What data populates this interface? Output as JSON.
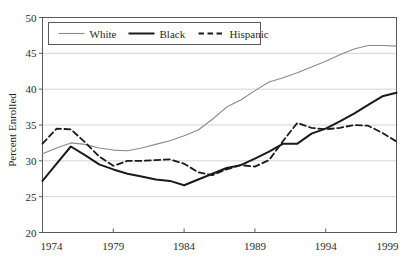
{
  "chart_data": {
    "type": "line",
    "title": "",
    "xlabel": "",
    "ylabel": "Percent Enrolled",
    "xlim": [
      1974,
      1999
    ],
    "ylim": [
      20,
      50
    ],
    "xticks": [
      1974,
      1979,
      1984,
      1989,
      1994,
      1999
    ],
    "yticks": [
      20,
      25,
      30,
      35,
      40,
      45,
      50
    ],
    "grid": "horizontal",
    "legend_position": "top-left-inside",
    "x": [
      1974,
      1975,
      1976,
      1977,
      1978,
      1979,
      1980,
      1981,
      1982,
      1983,
      1984,
      1985,
      1986,
      1987,
      1988,
      1989,
      1990,
      1991,
      1992,
      1993,
      1994,
      1995,
      1996,
      1997,
      1998,
      1999
    ],
    "series": [
      {
        "name": "White",
        "color": "#8a8a8a",
        "style": "solid",
        "width": 1.1,
        "values": [
          31.0,
          31.8,
          32.5,
          32.3,
          31.8,
          31.5,
          31.4,
          31.8,
          32.3,
          32.8,
          33.5,
          34.3,
          35.8,
          37.5,
          38.5,
          39.8,
          41.0,
          41.6,
          42.3,
          43.1,
          43.9,
          44.8,
          45.6,
          46.1,
          46.1,
          46.0
        ]
      },
      {
        "name": "Black",
        "color": "#1a1a1a",
        "style": "solid",
        "width": 2.0,
        "values": [
          27.2,
          29.6,
          32.0,
          30.8,
          29.5,
          28.8,
          28.2,
          27.8,
          27.4,
          27.2,
          26.6,
          27.4,
          28.2,
          29.0,
          29.4,
          30.3,
          31.3,
          32.4,
          32.4,
          33.8,
          34.5,
          35.5,
          36.6,
          37.8,
          39.0,
          39.5
        ]
      },
      {
        "name": "Hispanic",
        "color": "#1a1a1a",
        "style": "dashed",
        "width": 1.8,
        "values": [
          32.4,
          34.5,
          34.4,
          32.6,
          30.6,
          29.3,
          30.0,
          30.0,
          30.1,
          30.2,
          29.6,
          28.4,
          28.0,
          28.8,
          29.4,
          29.2,
          30.1,
          32.8,
          35.3,
          34.6,
          34.4,
          34.6,
          35.0,
          34.9,
          33.9,
          32.7
        ]
      }
    ]
  },
  "legend": {
    "items": [
      {
        "label": "White"
      },
      {
        "label": "Black"
      },
      {
        "label": "Hispanic"
      }
    ]
  },
  "axes": {
    "y_title": "Percent Enrolled",
    "y_tick_labels": [
      "50",
      "45",
      "40",
      "35",
      "30",
      "25",
      "20"
    ],
    "x_tick_labels": [
      "1974",
      "1979",
      "1984",
      "1989",
      "1994",
      "1999"
    ]
  }
}
